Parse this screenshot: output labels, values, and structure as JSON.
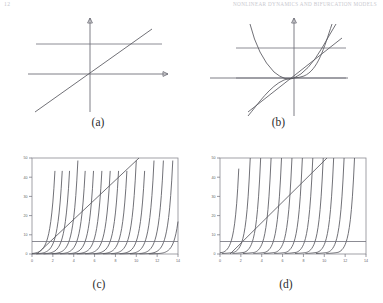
{
  "running_head": {
    "folio": "12",
    "title": "Nonlinear Dynamics and Bifurcation Models"
  },
  "panels": [
    {
      "id": "a",
      "caption": "(a)"
    },
    {
      "id": "b",
      "caption": "(b)"
    },
    {
      "id": "c",
      "caption": "(c)"
    },
    {
      "id": "d",
      "caption": "(d)"
    }
  ],
  "chart_data": [
    {
      "type": "line",
      "panel": "a",
      "title": "(a)",
      "xlabel": "",
      "ylabel": "",
      "grid": false,
      "legend": "none",
      "axes_style": "arrow-axes-through-origin",
      "xlim": [
        -1,
        1
      ],
      "ylim": [
        -1,
        1
      ],
      "series": [
        {
          "name": "identity-line",
          "description": "straight line of positive slope through the origin",
          "x": [
            -0.82,
            0.82
          ],
          "y": [
            -0.78,
            0.78
          ]
        },
        {
          "name": "horizontal-reference",
          "description": "horizontal line above the x-axis",
          "x": [
            -0.88,
            0.88
          ],
          "y": [
            0.4,
            0.4
          ]
        }
      ]
    },
    {
      "type": "line",
      "panel": "b",
      "title": "(b)",
      "xlabel": "",
      "ylabel": "",
      "grid": false,
      "legend": "none",
      "axes_style": "arrow-axes-through-origin",
      "xlim": [
        -1,
        1
      ],
      "ylim": [
        -1,
        1
      ],
      "series": [
        {
          "name": "parabola",
          "description": "upward opening parabola with vertex at the origin",
          "x": [
            -0.78,
            -0.6,
            -0.4,
            -0.2,
            0,
            0.2,
            0.4,
            0.6,
            0.72
          ],
          "y": [
            0.95,
            0.56,
            0.25,
            0.06,
            0,
            0.06,
            0.25,
            0.56,
            0.81
          ]
        },
        {
          "name": "cubic",
          "description": "S-shaped cubic through the origin",
          "x": [
            -0.72,
            -0.5,
            -0.3,
            -0.1,
            0,
            0.1,
            0.3,
            0.5,
            0.7
          ],
          "y": [
            -0.86,
            -0.3,
            -0.07,
            -0.002,
            0,
            0.002,
            0.07,
            0.3,
            0.86
          ]
        },
        {
          "name": "identity-line",
          "description": "straight line of positive slope through the origin",
          "x": [
            -0.8,
            0.8
          ],
          "y": [
            -0.62,
            0.62
          ]
        },
        {
          "name": "upper-horizontal-reference",
          "x": [
            -0.9,
            0.9
          ],
          "y": [
            0.4,
            0.4
          ]
        },
        {
          "name": "lower-horizontal-reference",
          "x": [
            -0.9,
            0.9
          ],
          "y": [
            0.0,
            0.0
          ]
        }
      ]
    },
    {
      "type": "line",
      "panel": "c",
      "title": "(c)",
      "xlabel": "",
      "ylabel": "",
      "grid": false,
      "legend": "none",
      "axes_style": "boxed-frame-with-ticks",
      "xlim": [
        0,
        14
      ],
      "ylim": [
        0,
        50
      ],
      "xticks": [
        0,
        2,
        4,
        6,
        8,
        10,
        12,
        14
      ],
      "yticks": [
        0,
        10,
        20,
        30,
        40,
        50
      ],
      "description": "family of steeply rising exponential-type curves, each shifted right, plus a straight diagonal line and a low horizontal reference line",
      "series": [
        {
          "name": "curve-1",
          "shift": 0.15
        },
        {
          "name": "curve-2",
          "shift": 0.85
        },
        {
          "name": "curve-3",
          "shift": 1.55
        },
        {
          "name": "curve-4",
          "shift": 2.3
        },
        {
          "name": "curve-5",
          "shift": 3.05
        },
        {
          "name": "curve-6",
          "shift": 3.85
        },
        {
          "name": "curve-7",
          "shift": 4.65
        },
        {
          "name": "curve-8",
          "shift": 5.45
        },
        {
          "name": "curve-9",
          "shift": 6.25
        },
        {
          "name": "curve-10",
          "shift": 7.05
        },
        {
          "name": "curve-11",
          "shift": 7.9
        },
        {
          "name": "curve-12",
          "shift": 8.75
        },
        {
          "name": "curve-13",
          "shift": 9.6
        },
        {
          "name": "curve-14",
          "shift": 10.5
        },
        {
          "name": "curve-15",
          "shift": 11.4
        },
        {
          "name": "curve-16",
          "shift": 12.35
        },
        {
          "name": "diagonal-line",
          "x": [
            0.5,
            10.3
          ],
          "y": [
            0.0,
            50.0
          ]
        },
        {
          "name": "horizontal-reference",
          "x": [
            0,
            14
          ],
          "y": [
            6.5,
            6.5
          ]
        }
      ]
    },
    {
      "type": "line",
      "panel": "d",
      "title": "(d)",
      "xlabel": "",
      "ylabel": "",
      "grid": false,
      "legend": "none",
      "axes_style": "boxed-frame-with-ticks",
      "xlim": [
        0,
        14
      ],
      "ylim": [
        0,
        50
      ],
      "xticks": [
        0,
        2,
        4,
        6,
        8,
        10,
        12,
        14
      ],
      "yticks": [
        0,
        10,
        20,
        30,
        40,
        50
      ],
      "description": "family of steeply rising sigmoid-type curves flattening near the bottom before turning up, shifted progressively right, plus a straight diagonal line and a low horizontal reference line",
      "series": [
        {
          "name": "curve-1",
          "shift": 0.3
        },
        {
          "name": "curve-2",
          "shift": 1.35
        },
        {
          "name": "curve-3",
          "shift": 2.35
        },
        {
          "name": "curve-4",
          "shift": 3.35
        },
        {
          "name": "curve-5",
          "shift": 4.35
        },
        {
          "name": "curve-6",
          "shift": 5.35
        },
        {
          "name": "curve-7",
          "shift": 6.35
        },
        {
          "name": "curve-8",
          "shift": 7.35
        },
        {
          "name": "curve-9",
          "shift": 8.35
        },
        {
          "name": "curve-10",
          "shift": 9.35
        },
        {
          "name": "curve-11",
          "shift": 10.35
        },
        {
          "name": "curve-12",
          "shift": 11.35
        },
        {
          "name": "diagonal-line",
          "x": [
            0.9,
            10.3
          ],
          "y": [
            0.0,
            50.0
          ]
        },
        {
          "name": "horizontal-reference",
          "x": [
            0,
            14
          ],
          "y": [
            6.5,
            6.5
          ]
        }
      ]
    }
  ]
}
